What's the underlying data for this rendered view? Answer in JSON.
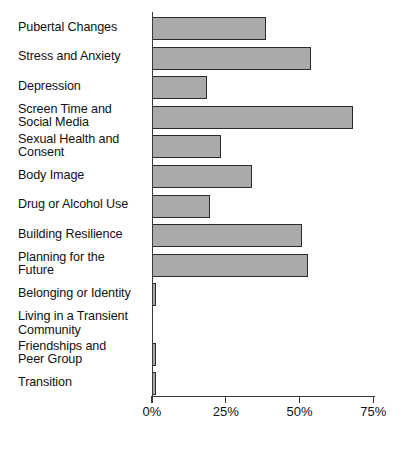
{
  "chart_data": {
    "type": "bar",
    "orientation": "horizontal",
    "title": "",
    "xlabel": "",
    "ylabel": "",
    "xlim": [
      0,
      75
    ],
    "grid": false,
    "legend": null,
    "value_suffix": "%",
    "bar_color": "#aaaaaa",
    "bar_edge_color": "#2b2b2b",
    "axis_color": "#3a3a3a",
    "text_color": "#111111",
    "x_ticks": [
      {
        "value": 0,
        "label": "0%"
      },
      {
        "value": 25,
        "label": "25%"
      },
      {
        "value": 50,
        "label": "50%"
      },
      {
        "value": 75,
        "label": "75%"
      }
    ],
    "categories": [
      "Pubertal Changes",
      "Stress and Anxiety",
      "Depression",
      "Screen Time and\nSocial Media",
      "Sexual Health and\nConsent",
      "Body Image",
      "Drug or Alcohol Use",
      "Building Resilience",
      "Planning for the\nFuture",
      "Belonging or Identity",
      "Living in a Transient\nCommunity",
      "Friendships and\nPeer Group",
      "Transition"
    ],
    "values": [
      38.5,
      54,
      18.5,
      68,
      23.5,
      34,
      19.5,
      51,
      53,
      1.5,
      0,
      1.5,
      1.5
    ]
  }
}
